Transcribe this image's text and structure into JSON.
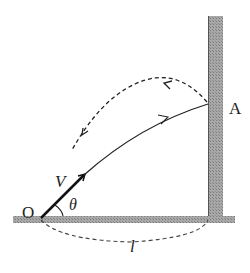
{
  "diagram": {
    "type": "projectile-wall",
    "labels": {
      "origin": "O",
      "velocity": "V",
      "angle": "θ",
      "wall_point": "A",
      "distance": "l"
    },
    "colors": {
      "wall_fill": "#9a9a9a",
      "line": "#222222"
    }
  }
}
